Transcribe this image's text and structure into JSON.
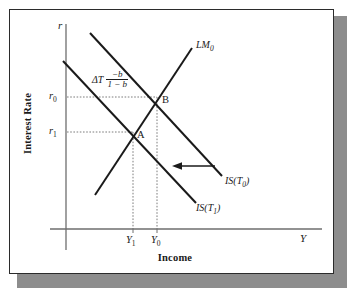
{
  "figure": {
    "axes": {
      "y_title": "Interest Rate",
      "x_title": "Income",
      "y_end_label": "r",
      "x_end_label": "Y"
    },
    "y_ticks": [
      {
        "base": "r",
        "sub": "0"
      },
      {
        "base": "r",
        "sub": "1"
      }
    ],
    "x_ticks": [
      {
        "base": "Y",
        "sub": "1"
      },
      {
        "base": "Y",
        "sub": "0"
      }
    ],
    "curves": [
      {
        "name": "LM0",
        "base": "LM",
        "sub": "0"
      },
      {
        "name": "IS_T0",
        "base": "IS(T",
        "sub": "0",
        "tail": ")"
      },
      {
        "name": "IS_T1",
        "base": "IS(T",
        "sub": "1",
        "tail": ")"
      }
    ],
    "points": [
      {
        "id": "A",
        "label": "A"
      },
      {
        "id": "B",
        "label": "B"
      }
    ],
    "annotation": {
      "delta": "ΔT",
      "numerator": "−b",
      "denominator": "1 − b"
    },
    "shift_arrow": {
      "name": "is-shift-arrow",
      "direction": "left"
    },
    "colors": {
      "line": "#1a1a1a",
      "axis": "#6e6e6e",
      "guide": "#6e6e6e",
      "frame": "#2b2b2b",
      "shadow": "#8d8d8d",
      "background": "#ffffff"
    }
  }
}
